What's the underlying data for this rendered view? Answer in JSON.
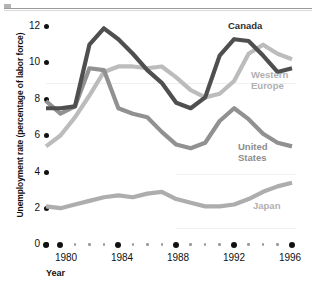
{
  "chart_data": {
    "type": "line",
    "title": "",
    "xlabel": "Year",
    "ylabel": "Unemployment rate (percentage of labor force)",
    "xlim": [
      1979,
      1996
    ],
    "ylim": [
      0,
      12
    ],
    "yticks": [
      0,
      2,
      4,
      6,
      8,
      10,
      12
    ],
    "xticks": [
      1980,
      1984,
      1988,
      1992,
      1996
    ],
    "xtick_labels": [
      "1980",
      "1984",
      "1988",
      "1992",
      "1996"
    ],
    "grid": false,
    "legend_position": "inline-right",
    "x": [
      1979,
      1980,
      1981,
      1982,
      1983,
      1984,
      1985,
      1986,
      1987,
      1988,
      1989,
      1990,
      1991,
      1992,
      1993,
      1994,
      1995,
      1996
    ],
    "series": [
      {
        "name": "Canada",
        "color": "#4f4f4f",
        "values": [
          7.5,
          7.5,
          7.6,
          11.0,
          11.9,
          11.3,
          10.5,
          9.6,
          8.9,
          7.8,
          7.5,
          8.1,
          10.4,
          11.3,
          11.2,
          10.4,
          9.5,
          9.7
        ]
      },
      {
        "name": "Western Europe",
        "color": "#bcbcbc",
        "values": [
          5.4,
          6.0,
          7.0,
          8.2,
          9.5,
          9.8,
          9.8,
          9.7,
          9.8,
          9.2,
          8.5,
          8.1,
          8.3,
          9.0,
          10.5,
          11.0,
          10.5,
          10.2
        ]
      },
      {
        "name": "United States",
        "color": "#919191",
        "values": [
          7.9,
          7.2,
          7.6,
          9.7,
          9.6,
          7.5,
          7.2,
          7.0,
          6.2,
          5.5,
          5.3,
          5.6,
          6.8,
          7.5,
          6.9,
          6.1,
          5.6,
          5.4
        ]
      },
      {
        "name": "Japan",
        "color": "#adadad",
        "values": [
          2.1,
          2.0,
          2.2,
          2.4,
          2.6,
          2.7,
          2.6,
          2.8,
          2.9,
          2.5,
          2.3,
          2.1,
          2.1,
          2.2,
          2.5,
          2.9,
          3.2,
          3.4
        ]
      }
    ]
  },
  "axis": {
    "y_title": "Unemployment rate (percentage of labor force)",
    "x_title": "Year",
    "y_ticks": [
      "12",
      "10",
      "8",
      "6",
      "4",
      "2",
      "0"
    ],
    "x_ticks": [
      "1980",
      "1984",
      "1988",
      "1992",
      "1996"
    ]
  },
  "series_labels": {
    "canada": "Canada",
    "western_europe": "Western\nEurope",
    "united_states": "United\nStates",
    "japan": "Japan"
  },
  "colors": {
    "canada": "#4f4f4f",
    "western_europe": "#bcbcbc",
    "united_states": "#919191",
    "japan": "#adadad",
    "axis": "#111111",
    "background": "#ffffff"
  }
}
